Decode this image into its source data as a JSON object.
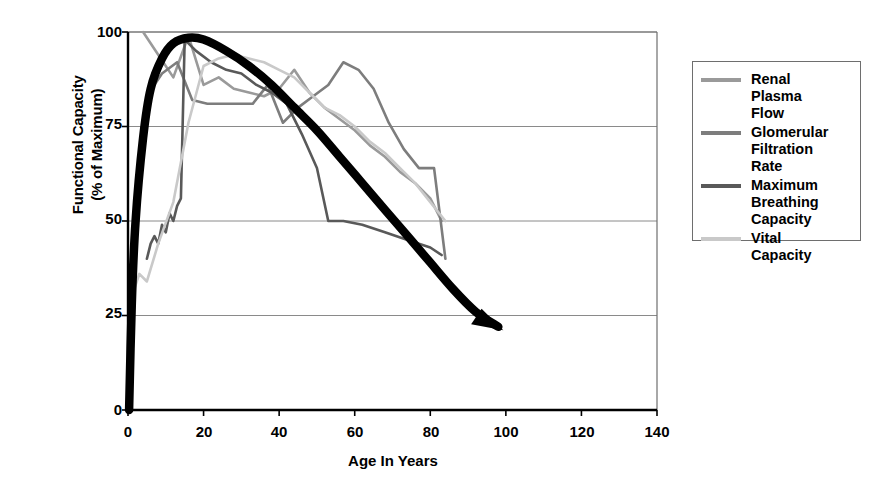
{
  "chart_data": {
    "type": "line",
    "title": "",
    "xlabel": "Age In Years",
    "ylabel": "Functional Capacity\n(% of Maximum)",
    "xlim": [
      0,
      140
    ],
    "ylim": [
      0,
      100
    ],
    "xticks": [
      0,
      20,
      40,
      60,
      80,
      100,
      120,
      140
    ],
    "yticks": [
      0,
      25,
      50,
      75,
      100
    ],
    "grid": "horizontal",
    "legend_position": "right-outside",
    "series": [
      {
        "name": "Renal Plasma Flow",
        "color": "#9a9a9a",
        "x": [
          4,
          8,
          12,
          16,
          20,
          24,
          28,
          32,
          36,
          40,
          44,
          48,
          52,
          56,
          60,
          64,
          68,
          72,
          76,
          80,
          83
        ],
        "values": [
          100,
          94,
          88,
          99,
          86,
          88,
          85,
          84,
          83,
          85,
          90,
          84,
          80,
          77,
          74,
          70,
          67,
          63,
          60,
          56,
          50
        ]
      },
      {
        "name": "Glomerular Filtration Rate",
        "color": "#7d7d7d",
        "x": [
          5,
          9,
          13,
          17,
          21,
          25,
          29,
          33,
          37,
          41,
          45,
          49,
          53,
          57,
          61,
          65,
          69,
          73,
          77,
          81,
          84
        ],
        "values": [
          83,
          89,
          92,
          82,
          81,
          81,
          81,
          81,
          86,
          76,
          80,
          83,
          86,
          92,
          90,
          85,
          76,
          69,
          64,
          64,
          40
        ]
      },
      {
        "name": "Maximum Breathing Capacity",
        "color": "#595959",
        "x": [
          5,
          6,
          7,
          8,
          9,
          10,
          11,
          12,
          13,
          14,
          15,
          16,
          18,
          22,
          26,
          30,
          34,
          38,
          42,
          46,
          50,
          53,
          57,
          62,
          68,
          74,
          80,
          83
        ],
        "values": [
          40,
          44,
          46,
          44,
          49,
          47,
          52,
          50,
          54,
          56,
          98,
          97,
          95,
          92,
          90,
          89,
          86,
          84,
          81,
          73,
          64,
          50,
          50,
          49,
          47,
          45,
          43,
          41
        ]
      },
      {
        "name": "Vital Capacity",
        "color": "#c9c9c9",
        "x": [
          1,
          3,
          5,
          8,
          12,
          16,
          20,
          24,
          28,
          32,
          36,
          40,
          44,
          48,
          52,
          56,
          60,
          64,
          68,
          72,
          76,
          80,
          84
        ],
        "values": [
          30,
          36,
          34,
          44,
          55,
          76,
          91,
          93,
          94,
          93,
          92,
          90,
          88,
          84,
          80,
          78,
          75,
          71,
          68,
          64,
          60,
          55,
          50
        ]
      }
    ],
    "trend_arrow": {
      "name": "overall-decline-trend",
      "color": "#000000",
      "x": [
        0.3,
        1,
        2,
        4,
        6,
        9,
        12,
        16,
        20,
        26,
        32,
        38,
        44,
        50,
        56,
        62,
        68,
        74,
        80,
        86,
        92,
        98
      ],
      "values": [
        0,
        28,
        50,
        72,
        85,
        93,
        97,
        98.5,
        98,
        95,
        91,
        86,
        80,
        74,
        67,
        60,
        53,
        46,
        39,
        32,
        26,
        22
      ]
    }
  },
  "legend": {
    "items": [
      {
        "label": "Renal\nPlasma\nFlow",
        "color": "#9a9a9a"
      },
      {
        "label": "Glomerular\nFiltration\nRate",
        "color": "#7d7d7d"
      },
      {
        "label": "Maximum\nBreathing\nCapacity",
        "color": "#595959"
      },
      {
        "label": "Vital\nCapacity",
        "color": "#c9c9c9"
      }
    ]
  },
  "axes": {
    "ylabel_line1": "Functional Capacity",
    "ylabel_line2": "(% of Maximum)",
    "xlabel": "Age In Years",
    "ytick_labels": [
      "100",
      "75",
      "50",
      "25",
      "0"
    ],
    "xtick_labels": [
      "0",
      "20",
      "40",
      "60",
      "80",
      "100",
      "120",
      "140"
    ]
  },
  "style": {
    "axis_color": "#000000",
    "grid_color": "#8a8a8a",
    "plot_border_color": "#6e6e6e",
    "background": "#ffffff"
  }
}
